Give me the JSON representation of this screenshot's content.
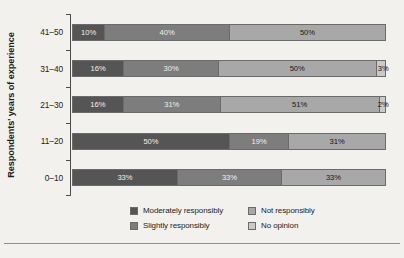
{
  "chart_data": {
    "type": "bar",
    "orientation": "horizontal",
    "stacked": true,
    "stacked_mode": "percent",
    "title": "",
    "subtitle": "",
    "xlabel": "",
    "ylabel": "Respondents' years of experience",
    "xlim": [
      0,
      100
    ],
    "grid": false,
    "legend_position": "bottom",
    "categories": [
      "41–50",
      "31–40",
      "21–30",
      "11–20",
      "0–10"
    ],
    "series": [
      {
        "name": "Moderately responsibly",
        "color": "#555555",
        "values": [
          10,
          16,
          16,
          50,
          33
        ]
      },
      {
        "name": "Slightly responsibly",
        "color": "#7d7d7d",
        "values": [
          40,
          30,
          31,
          19,
          33
        ]
      },
      {
        "name": "Not responsibly",
        "color": "#a8a8a8",
        "values": [
          50,
          50,
          51,
          31,
          33
        ]
      },
      {
        "name": "No opinion",
        "color": "#c9c9c9",
        "values": [
          0,
          3,
          2,
          0,
          0
        ]
      }
    ],
    "rows": [
      {
        "category": "41–50",
        "segments": [
          {
            "series": "Moderately responsibly",
            "value": 10,
            "label": "10%",
            "color": "#555555",
            "dark": true
          },
          {
            "series": "Slightly responsibly",
            "value": 40,
            "label": "40%",
            "color": "#7d7d7d",
            "dark": true
          },
          {
            "series": "Not responsibly",
            "value": 50,
            "label": "50%",
            "color": "#a8a8a8",
            "dark": false
          }
        ]
      },
      {
        "category": "31–40",
        "segments": [
          {
            "series": "Moderately responsibly",
            "value": 16,
            "label": "16%",
            "color": "#555555",
            "dark": true
          },
          {
            "series": "Slightly responsibly",
            "value": 30,
            "label": "30%",
            "color": "#7d7d7d",
            "dark": true
          },
          {
            "series": "Not responsibly",
            "value": 50,
            "label": "50%",
            "color": "#a8a8a8",
            "dark": false
          },
          {
            "series": "No opinion",
            "value": 3,
            "label": "3%",
            "color": "#c9c9c9",
            "dark": false,
            "tiny": true
          }
        ]
      },
      {
        "category": "21–30",
        "segments": [
          {
            "series": "Moderately responsibly",
            "value": 16,
            "label": "16%",
            "color": "#555555",
            "dark": true
          },
          {
            "series": "Slightly responsibly",
            "value": 31,
            "label": "31%",
            "color": "#7d7d7d",
            "dark": true
          },
          {
            "series": "Not responsibly",
            "value": 51,
            "label": "51%",
            "color": "#a8a8a8",
            "dark": false
          },
          {
            "series": "No opinion",
            "value": 2,
            "label": "2%",
            "color": "#c9c9c9",
            "dark": false,
            "tiny": true
          }
        ]
      },
      {
        "category": "11–20",
        "segments": [
          {
            "series": "Moderately responsibly",
            "value": 50,
            "label": "50%",
            "color": "#555555",
            "dark": true
          },
          {
            "series": "Slightly responsibly",
            "value": 19,
            "label": "19%",
            "color": "#7d7d7d",
            "dark": true
          },
          {
            "series": "Not responsibly",
            "value": 31,
            "label": "31%",
            "color": "#a8a8a8",
            "dark": false
          }
        ]
      },
      {
        "category": "0–10",
        "segments": [
          {
            "series": "Moderately responsibly",
            "value": 33,
            "label": "33%",
            "color": "#555555",
            "dark": true
          },
          {
            "series": "Slightly responsibly",
            "value": 33,
            "label": "33%",
            "color": "#7d7d7d",
            "dark": true
          },
          {
            "series": "Not responsibly",
            "value": 33,
            "label": "33%",
            "color": "#a8a8a8",
            "dark": false
          }
        ]
      }
    ],
    "legend": [
      {
        "label": "Moderately responsibly",
        "color": "#555555"
      },
      {
        "label": "Not responsibly",
        "color": "#a8a8a8"
      },
      {
        "label": "Slightly responsibly",
        "color": "#7d7d7d"
      },
      {
        "label": "No opinion",
        "color": "#c9c9c9"
      }
    ]
  },
  "figure": {
    "background_color": "#f2f1ee",
    "axis_color": "#4d4d4d",
    "segment_border_color": "#6b6b6b",
    "rule_color": "#8e8e8e"
  }
}
